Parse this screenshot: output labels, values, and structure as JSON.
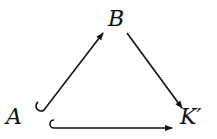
{
  "diagram": {
    "type": "commutative-triangle",
    "nodes": [
      {
        "id": "A",
        "label": "A"
      },
      {
        "id": "B",
        "label": "B"
      },
      {
        "id": "K",
        "label": "K′"
      }
    ],
    "edges": [
      {
        "from": "A",
        "to": "B",
        "style": "hook-arrow"
      },
      {
        "from": "B",
        "to": "K",
        "style": "arrow"
      },
      {
        "from": "A",
        "to": "K",
        "style": "hook-arrow"
      }
    ],
    "colors": {
      "ink": "#111111",
      "background": "#ffffff"
    }
  }
}
